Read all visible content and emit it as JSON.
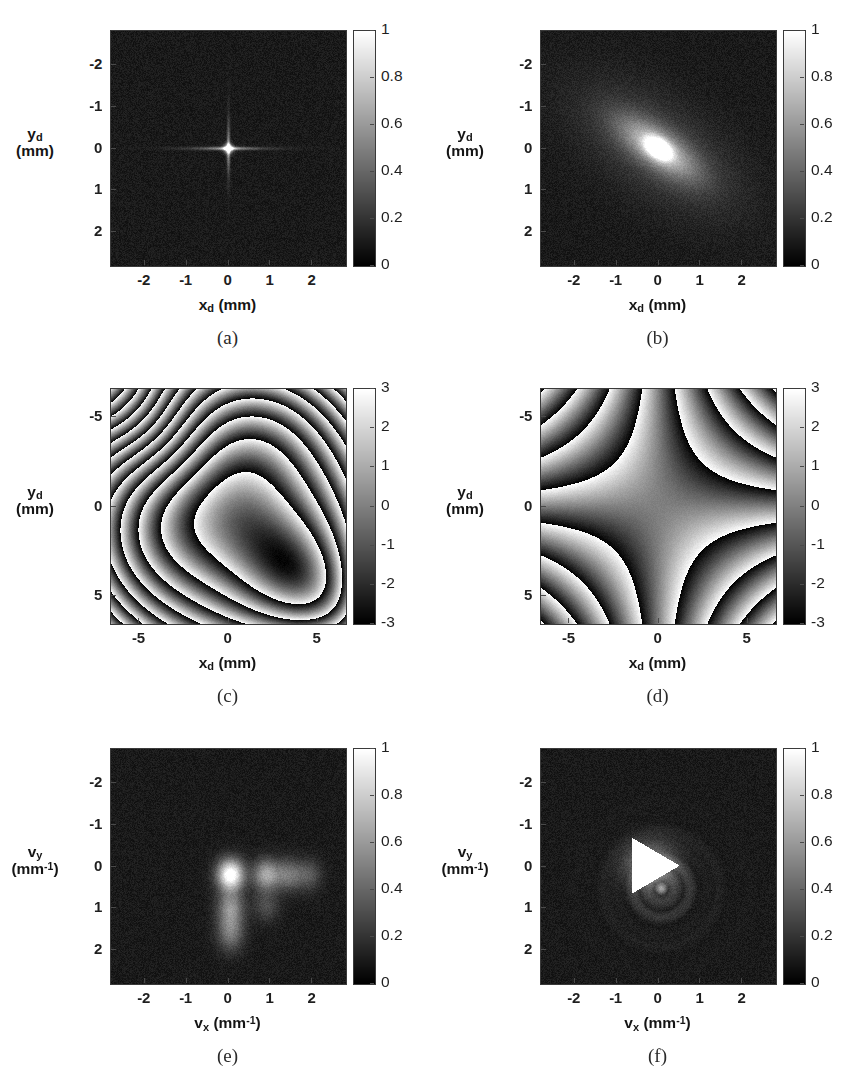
{
  "figure": {
    "background": "#ffffff",
    "panel_count": 6,
    "colormap": "grayscale-linear"
  },
  "chart_data": [
    {
      "id": "a",
      "type": "heatmap",
      "caption": "(a)",
      "title": "",
      "xlabel": "x_d (mm)",
      "xlabel_base": "x",
      "xlabel_sub": "d",
      "xlabel_unit": "(mm)",
      "ylabel_base": "y",
      "ylabel_sub": "d",
      "ylabel_unit": "(mm)",
      "xticks": [
        "-2",
        "-1",
        "0",
        "1",
        "2"
      ],
      "xtick_values": [
        -2,
        -1,
        0,
        1,
        2
      ],
      "yticks": [
        "-2",
        "-1",
        "0",
        "1",
        "2"
      ],
      "ytick_values": [
        -2,
        -1,
        0,
        1,
        2
      ],
      "xlim": [
        -2.8,
        2.8
      ],
      "ylim": [
        -2.8,
        2.8
      ],
      "y_axis_inverted": true,
      "colorbar_ticks": [
        "1",
        "0.8",
        "0.6",
        "0.4",
        "0.2",
        "0"
      ],
      "colorbar_values": [
        1,
        0.8,
        0.6,
        0.4,
        0.2,
        0
      ],
      "clim": [
        0,
        1
      ],
      "grid": false,
      "pattern": "cross-psf",
      "description": "Narrow cross-shaped point spread function at origin on noisy dark background",
      "peak": {
        "x": 0,
        "y": 0,
        "value": 1.0
      },
      "noise_level": 0.09,
      "background_level": 0.1
    },
    {
      "id": "b",
      "type": "heatmap",
      "caption": "(b)",
      "title": "",
      "xlabel": "x_d (mm)",
      "xlabel_base": "x",
      "xlabel_sub": "d",
      "xlabel_unit": "(mm)",
      "ylabel_base": "y",
      "ylabel_sub": "d",
      "ylabel_unit": "(mm)",
      "xticks": [
        "-2",
        "-1",
        "0",
        "1",
        "2"
      ],
      "xtick_values": [
        -2,
        -1,
        0,
        1,
        2
      ],
      "yticks": [
        "-2",
        "-1",
        "0",
        "1",
        "2"
      ],
      "ytick_values": [
        -2,
        -1,
        0,
        1,
        2
      ],
      "xlim": [
        -2.8,
        2.8
      ],
      "ylim": [
        -2.8,
        2.8
      ],
      "y_axis_inverted": true,
      "colorbar_ticks": [
        "1",
        "0.8",
        "0.6",
        "0.4",
        "0.2",
        "0"
      ],
      "colorbar_values": [
        1,
        0.8,
        0.6,
        0.4,
        0.2,
        0
      ],
      "clim": [
        0,
        1
      ],
      "grid": false,
      "pattern": "elliptical-blob",
      "description": "Diagonally elongated elliptical bright blob centred at origin, tilted about 35 degrees",
      "peak": {
        "x": 0,
        "y": 0,
        "value": 1.0
      },
      "blob_sigma_major": 0.75,
      "blob_sigma_minor": 0.3,
      "blob_angle_deg": 35,
      "noise_level": 0.09,
      "background_level": 0.1
    },
    {
      "id": "c",
      "type": "heatmap",
      "caption": "(c)",
      "title": "",
      "xlabel": "x_d (mm)",
      "xlabel_base": "x",
      "xlabel_sub": "d",
      "xlabel_unit": "(mm)",
      "ylabel_base": "y",
      "ylabel_sub": "d",
      "ylabel_unit": "(mm)",
      "xticks": [
        "-5",
        "0",
        "5"
      ],
      "xtick_values": [
        -5,
        0,
        5
      ],
      "yticks": [
        "-5",
        "0",
        "5"
      ],
      "ytick_values": [
        -5,
        0,
        5
      ],
      "xlim": [
        -6.6,
        6.6
      ],
      "ylim": [
        -6.6,
        6.6
      ],
      "y_axis_inverted": true,
      "colorbar_ticks": [
        "3",
        "2",
        "1",
        "0",
        "-1",
        "-2",
        "-3"
      ],
      "colorbar_values": [
        3,
        2,
        1,
        0,
        -1,
        -2,
        -3
      ],
      "clim": [
        -3.14159,
        3.14159
      ],
      "grid": false,
      "pattern": "wrapped-phase-defocus-coma",
      "description": "Wrapped phase map, concentric fringes distorted into a diagonal lobed S shape near centre",
      "defocus_coeff": 0.52,
      "diagonal_coeff": 0.62,
      "noise_level": 0.08
    },
    {
      "id": "d",
      "type": "heatmap",
      "caption": "(d)",
      "title": "",
      "xlabel": "x_d (mm)",
      "xlabel_base": "x",
      "xlabel_sub": "d",
      "xlabel_unit": "(mm)",
      "ylabel_base": "y",
      "ylabel_sub": "d",
      "ylabel_unit": "(mm)",
      "xticks": [
        "-5",
        "0",
        "5"
      ],
      "xtick_values": [
        -5,
        0,
        5
      ],
      "yticks": [
        "-5",
        "0",
        "5"
      ],
      "ytick_values": [
        -5,
        0,
        5
      ],
      "xlim": [
        -6.6,
        6.6
      ],
      "ylim": [
        -6.6,
        6.6
      ],
      "y_axis_inverted": true,
      "colorbar_ticks": [
        "3",
        "2",
        "1",
        "0",
        "-1",
        "-2",
        "-3"
      ],
      "colorbar_values": [
        3,
        2,
        1,
        0,
        -1,
        -2,
        -3
      ],
      "clim": [
        -3.14159,
        3.14159
      ],
      "grid": false,
      "pattern": "wrapped-phase-astigmatism",
      "description": "Wrapped phase map with four-armed saddle (astigmatic) fringe pattern, hyperbolic fringes in the four corners",
      "astig_coeff": 0.26,
      "noise_level": 0.08
    },
    {
      "id": "e",
      "type": "heatmap",
      "caption": "(e)",
      "title": "",
      "xlabel": "v_x (mm^-1)",
      "xlabel_base": "v",
      "xlabel_sub": "x",
      "xlabel_unit": "(mm",
      "xlabel_sup": "-1",
      "xlabel_unit_close": ")",
      "ylabel_base": "v",
      "ylabel_sub": "y",
      "ylabel_unit": "(mm",
      "ylabel_sup": "-1",
      "ylabel_unit_close": ")",
      "xticks": [
        "-2",
        "-1",
        "0",
        "1",
        "2"
      ],
      "xtick_values": [
        -2,
        -1,
        0,
        1,
        2
      ],
      "yticks": [
        "-2",
        "-1",
        "0",
        "1",
        "2"
      ],
      "ytick_values": [
        -2,
        -1,
        0,
        1,
        2
      ],
      "xlim": [
        -2.8,
        2.8
      ],
      "ylim": [
        -2.8,
        2.8
      ],
      "y_axis_inverted": true,
      "colorbar_ticks": [
        "1",
        "0.8",
        "0.6",
        "0.4",
        "0.2",
        "0"
      ],
      "colorbar_values": [
        1,
        0.8,
        0.6,
        0.4,
        0.2,
        0
      ],
      "clim": [
        0,
        1
      ],
      "grid": false,
      "pattern": "diffraction-orders",
      "description": "Bright zero order near origin with decaying diffraction orders to the right along vx and a weaker series downward along vy",
      "orders_x": [
        {
          "vx": 0.05,
          "vy": 0.2,
          "amp": 1.0
        },
        {
          "vx": 0.9,
          "vy": 0.2,
          "amp": 0.55
        },
        {
          "vx": 1.42,
          "vy": 0.2,
          "amp": 0.35
        },
        {
          "vx": 1.9,
          "vy": 0.2,
          "amp": 0.25
        }
      ],
      "orders_y": [
        {
          "vx": 0.05,
          "vy": 0.95,
          "amp": 0.42
        },
        {
          "vx": 0.05,
          "vy": 1.4,
          "amp": 0.3
        },
        {
          "vx": 0.05,
          "vy": 1.75,
          "amp": 0.2
        },
        {
          "vx": 0.9,
          "vy": 0.95,
          "amp": 0.2
        }
      ],
      "noise_level": 0.09,
      "background_level": 0.1
    },
    {
      "id": "f",
      "type": "heatmap",
      "caption": "(f)",
      "title": "",
      "xlabel": "v_x (mm^-1)",
      "xlabel_base": "v",
      "xlabel_sub": "x",
      "xlabel_unit": "(mm",
      "xlabel_sup": "-1",
      "xlabel_unit_close": ")",
      "ylabel_base": "v",
      "ylabel_sub": "y",
      "ylabel_unit": "(mm",
      "ylabel_sup": "-1",
      "ylabel_unit_close": ")",
      "xticks": [
        "-2",
        "-1",
        "0",
        "1",
        "2"
      ],
      "xtick_values": [
        -2,
        -1,
        0,
        1,
        2
      ],
      "yticks": [
        "-2",
        "-1",
        "0",
        "1",
        "2"
      ],
      "ytick_values": [
        -2,
        -1,
        0,
        1,
        2
      ],
      "xlim": [
        -2.8,
        2.8
      ],
      "ylim": [
        -2.8,
        2.8
      ],
      "y_axis_inverted": true,
      "colorbar_ticks": [
        "1",
        "0.8",
        "0.6",
        "0.4",
        "0.2",
        "0"
      ],
      "colorbar_values": [
        1,
        0.8,
        0.6,
        0.4,
        0.2,
        0
      ],
      "clim": [
        0,
        1
      ],
      "grid": false,
      "pattern": "triangle-order",
      "description": "Saturated bright triangle pointing right just above the origin, with faint curved fringe arcs below and to the right",
      "triangle": {
        "cx": -0.18,
        "cy": -0.02,
        "size": 0.72,
        "orientation": "right"
      },
      "noise_level": 0.09,
      "background_level": 0.1
    }
  ],
  "footer": {
    "scan_artifact": ""
  }
}
